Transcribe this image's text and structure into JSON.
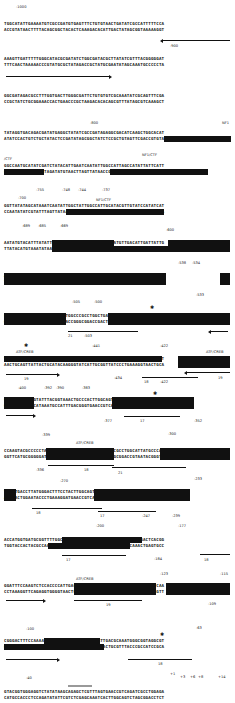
{
  "figure": {
    "type": "annotated promoter DNA sequence",
    "blocks": [
      {
        "top": "TGGCATATTGAAAATGTCGCCGATGTGAGTTTCTGTGTAACTGATATCGCCATTTTTCCA",
        "bottom": "ACCGTATAACTTTTACAGCGGCTACACTCAAAGACACATTGACTATAGCGGTAAAAAGGT",
        "labels": [
          "-1000",
          "-900"
        ]
      },
      {
        "top": "AAAGTTGATTTTTGGGCATACGCGATATCTGGCGATACGCTTATATCGTTTACGGGGGAT",
        "bottom": "TTTCAACTAAAAACCCGTATGCGCTATAGACCGCTATGCGAATATAGCAAATGCCCCCTA",
        "labels": []
      },
      {
        "top": "GGCGATAGACGCCTTTGGTGACTTGGGCGATTCTGTGTGTCGCAAATATCGCAGTTTCGA",
        "bottom": "CCGCTATCTGCGGAAACCACTGAACCCGCTAAGACACACAGCGTTTATAGCGTCAAAGCT",
        "labels": []
      },
      {
        "top": "TATAGGTGACAGACGATATGAGGCTATATCGCCGATAGAGGCGACATCAAGCTGGCACAT",
        "bottom": "ATATCCACTGTCTGCTATACTCCGATATAGCGGCTATCTCCGCTGTAGTTCGACCGTGTA",
        "labels": [
          "-800",
          "NF1"
        ]
      },
      {
        "top": "GGCCAATGCATATCGATCTATACATTGAATCAATATTGGCCATTAGCCATATTATTCATT",
        "bottom": "CCGGTTACGTATAGCTAGATATGTAACTTAGTTATAACCGGTAATCGGTATAATAAGTAA",
        "labels": [
          "/CTF",
          "NF1/CTF",
          "-755",
          "-748",
          "-744",
          "-737"
        ]
      },
      {
        "top": "GGTTATATAGCATAAATCAATATTGGCTATTGGCCATTGCATACGTTGTATCCATATCAT",
        "bottom": "CCAATATATCGTATTTAGTTATAACCGATAACCGGTAACGTATGCAACATAGGTATAGTA",
        "labels": [
          "-700",
          "NF1/CTF",
          "-689",
          "-685",
          "-669"
        ]
      },
      {
        "top": "AATATGTACATTTATATTGGCTCATGTCCAACATTACCGCCATGTTGACATTGATTATTG",
        "bottom": "TTATACATGTAAATATAACCGAGTACAGGTTGTAATGGCGGTACAACTGTAACTAATAAC",
        "labels": [
          "-600"
        ]
      },
      {
        "top": "ACTAGTTATTAATAGTAATCAATTACGGGGTCATTAGTTCATAGCCCATATATGGAGTTC",
        "bottom": "TGATCAATAATTATCATTAGTTAATGCCCCAGTAATCAAGTATCGGGTATATACCTCAAG",
        "labels": [
          "-538",
          "-534",
          "-533"
        ]
      },
      {
        "top": "CGCGTTACATAACTTACGGTAAATGGCCCGCCTGGCTGACCGCCCAACGACCCCCGCCCA",
        "bottom": "GCGCAATGTATTGAATGCCATTTACCGGGCGGACCGACTGGCGGGTTGCTGGGGGCGGGT",
        "labels": [
          "-505",
          "-500",
          "21",
          "-503"
        ]
      },
      {
        "top": "TTGACGTCAATAATGACGTATGTTCCCATAGTAACGCCAATAGGGACTTTCCATTGACGT",
        "bottom": "AACTGCAGTTATTACTGCATACAAGGGTATCATTGCGGTTATCCCTGAAAGGTAACTGCA",
        "labels": [
          "ATF/CREB",
          "-441",
          "-422",
          "ATF/CREB",
          "19",
          "-434",
          "18",
          "-422",
          "19"
        ]
      },
      {
        "top": "CAATGGGTGGAGTATTTACGGTAAACTGCCCACTTGGCAGTACATCAAGTGTATCATATG",
        "bottom": "GTTACCCACCTCATAAATGCCATTTGACGGGTGAACCGTCATGTAGTTCACATAGTATAC",
        "labels": [
          "-400",
          "-392",
          "-390",
          "-383",
          "-377",
          "17",
          "-352"
        ]
      },
      {
        "top": "CCAAGTACGCCCCCTATTGACGTCAATGACGGTAAATGGCCCGCCTGGCATTATGCCCAG",
        "bottom": "GGTTCATGCGGGGGATAACTGCAGTTACTGCCATTTACCGGGCGGACCGTAATACGGGTC",
        "labels": [
          "-339",
          "ATF/CREB",
          "-300",
          "-336",
          "18",
          "21"
        ]
      },
      {
        "top": "TACATGACCTTATGGGACTTTCCTACTTGGCAGTACATCTACGTATTAGTCATCGCTATT",
        "bottom": "ATGTACTGGAATACCCTGAAAGGATGAACCGTCATGTAGATGCATAATCAGTAGCGATAA",
        "labels": [
          "-270",
          "-233",
          "18",
          "17",
          "-247",
          "-239"
        ]
      },
      {
        "top": "ACCATGGTGATGCGGTTTTGGCAGTACATCAATGGGCGTGGATAGCGGTTTGACTCACGG",
        "bottom": "TGGTACCACTACGCCAAAACCGTCATGTAGTTACCCGCACCTATCGCCAAACTGAGTGCC",
        "labels": [
          "-200",
          "-177",
          "17",
          "-184",
          "18"
        ]
      },
      {
        "top": "GGATTTCCAAGTCTCCACCCCATTGACGTCAATGGGAGTTTGTTTTGGCACCAAAATCAA",
        "bottom": "CCTAAAGGTTCAGAGGTGGGGTAACTGCAGTTACCCTCAAACAAAACCGTGGTTTTAGTT",
        "labels": [
          "ATF/CREB",
          "-123",
          "-115",
          "18",
          "-109"
        ]
      },
      {
        "top": "CGGGACTTTCCAAAATGTCGTAACAACTCCGCCCCATTGACGCAAATGGGCGGTAGGCGT",
        "bottom": "GCCCTGAAAGGTTTTACAGCATTGTTGAGGCGGGGTAACTGCGTTTACCCGCCATCCGCA",
        "labels": [
          "-100",
          "-63",
          "18"
        ]
      },
      {
        "top": "GTACGGTGGGAGGTCTATATAAGCAGAGCTCGTTTAGTGAACCGTCAGATCGCCTGGAGA",
        "bottom": "CATGCCACCCTCCAGATATATTCGTCTCGAGCAAATCACTTGGCAGTCTAGCGGACCTCT",
        "labels": [
          "-40",
          "+1",
          "+3",
          "+6",
          "+8",
          "+14"
        ]
      }
    ]
  }
}
